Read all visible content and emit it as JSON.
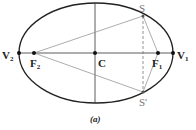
{
  "diagram": {
    "caption": "(a)",
    "labels": {
      "V2": "V",
      "V2_sub": "2",
      "V1": "V",
      "V1_sub": "1",
      "F2": "F",
      "F2_sub": "2",
      "F1": "F",
      "F1_sub": "1",
      "C": "C",
      "S": "S",
      "S_prime": "S'"
    },
    "points": {
      "V2": [
        19,
        53
      ],
      "F2": [
        34,
        53
      ],
      "C": [
        95,
        53
      ],
      "F1": [
        158,
        53
      ],
      "V1": [
        173,
        53
      ],
      "S": [
        143,
        16
      ],
      "S_prime": [
        143,
        92
      ]
    },
    "ellipse": {
      "cx": 96,
      "cy": 53,
      "rx": 77,
      "ry": 50
    },
    "colors": {
      "stroke": "#222222",
      "chord": "#888888"
    }
  }
}
